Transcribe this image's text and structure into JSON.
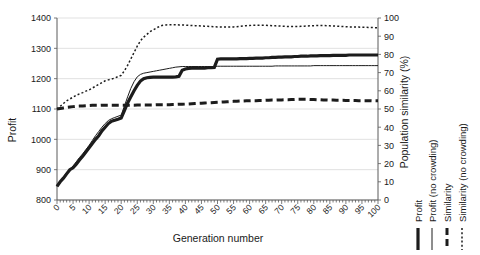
{
  "chart_data": {
    "type": "line",
    "title": "",
    "xlabel": "Generation number",
    "ylabel": "Profit",
    "y2label": "Population similarity (%)",
    "xlim": [
      0,
      100
    ],
    "ylim": [
      800,
      1400
    ],
    "y2lim": [
      0,
      100
    ],
    "grid": true,
    "legend_position": "right-outside-vertical",
    "xticks": [
      0,
      5,
      10,
      15,
      20,
      25,
      30,
      35,
      40,
      45,
      50,
      55,
      60,
      65,
      70,
      75,
      80,
      85,
      90,
      95,
      100
    ],
    "yticks": [
      800,
      900,
      1000,
      1100,
      1200,
      1300,
      1400
    ],
    "y2ticks": [
      0,
      10,
      20,
      30,
      40,
      50,
      60,
      70,
      80,
      90,
      100
    ],
    "x": [
      0,
      1,
      2,
      3,
      4,
      5,
      6,
      7,
      8,
      9,
      10,
      11,
      12,
      13,
      14,
      15,
      16,
      17,
      18,
      19,
      20,
      21,
      22,
      23,
      24,
      25,
      26,
      27,
      28,
      29,
      30,
      31,
      32,
      33,
      34,
      35,
      36,
      37,
      38,
      39,
      40,
      41,
      42,
      43,
      44,
      45,
      46,
      47,
      48,
      49,
      50,
      51,
      52,
      53,
      54,
      55,
      56,
      57,
      58,
      59,
      60,
      61,
      62,
      63,
      64,
      65,
      66,
      67,
      68,
      69,
      70,
      71,
      72,
      73,
      74,
      75,
      76,
      77,
      78,
      79,
      80,
      81,
      82,
      83,
      84,
      85,
      86,
      87,
      88,
      89,
      90,
      91,
      92,
      93,
      94,
      95,
      96,
      97,
      98,
      99,
      100
    ],
    "series": [
      {
        "name": "Profit",
        "axis": "left",
        "style": "thick-solid",
        "values": [
          845,
          860,
          872,
          886,
          900,
          906,
          918,
          932,
          944,
          958,
          972,
          986,
          1000,
          1012,
          1028,
          1040,
          1052,
          1060,
          1063,
          1066,
          1070,
          1095,
          1120,
          1140,
          1160,
          1178,
          1192,
          1200,
          1203,
          1204,
          1205,
          1205,
          1205,
          1205,
          1205,
          1205,
          1205,
          1206,
          1208,
          1228,
          1232,
          1234,
          1235,
          1235,
          1235,
          1235,
          1235,
          1236,
          1236,
          1237,
          1264,
          1265,
          1265,
          1265,
          1265,
          1265,
          1265,
          1266,
          1266,
          1266,
          1267,
          1267,
          1268,
          1268,
          1268,
          1269,
          1269,
          1270,
          1270,
          1271,
          1271,
          1272,
          1272,
          1272,
          1273,
          1273,
          1274,
          1274,
          1274,
          1275,
          1275,
          1275,
          1276,
          1276,
          1276,
          1276,
          1277,
          1277,
          1277,
          1277,
          1277,
          1278,
          1278,
          1278,
          1278,
          1278,
          1278,
          1278,
          1278,
          1278,
          1278
        ]
      },
      {
        "name": "Profit (no crowding)",
        "axis": "left",
        "style": "thin-solid",
        "values": [
          845,
          862,
          876,
          890,
          902,
          912,
          926,
          940,
          952,
          966,
          980,
          996,
          1012,
          1026,
          1040,
          1052,
          1062,
          1068,
          1072,
          1076,
          1080,
          1110,
          1140,
          1168,
          1190,
          1206,
          1214,
          1218,
          1220,
          1222,
          1224,
          1226,
          1228,
          1230,
          1232,
          1234,
          1236,
          1238,
          1239,
          1240,
          1240,
          1240,
          1240,
          1240,
          1240,
          1240,
          1240,
          1240,
          1240,
          1240,
          1241,
          1241,
          1241,
          1241,
          1241,
          1241,
          1241,
          1241,
          1241,
          1241,
          1241,
          1241,
          1241,
          1241,
          1241,
          1241,
          1241,
          1241,
          1242,
          1242,
          1242,
          1242,
          1242,
          1242,
          1242,
          1242,
          1242,
          1242,
          1242,
          1242,
          1243,
          1243,
          1243,
          1243,
          1243,
          1243,
          1243,
          1243,
          1243,
          1243,
          1243,
          1243,
          1243,
          1243,
          1243,
          1243,
          1243,
          1243,
          1243,
          1243,
          1243
        ]
      },
      {
        "name": "Similarity",
        "axis": "right",
        "style": "thick-dashed",
        "values": [
          50.0,
          50.3,
          50.6,
          50.9,
          51.1,
          51.3,
          51.5,
          51.6,
          51.7,
          51.8,
          51.9,
          52.0,
          52.0,
          52.0,
          52.1,
          52.1,
          52.1,
          52.1,
          52.1,
          52.1,
          52.1,
          52.1,
          52.1,
          52.1,
          52.1,
          52.2,
          52.2,
          52.2,
          52.2,
          52.2,
          52.2,
          52.3,
          52.3,
          52.3,
          52.4,
          52.4,
          52.5,
          52.5,
          52.6,
          52.6,
          52.7,
          52.8,
          52.9,
          53.0,
          53.1,
          53.2,
          53.3,
          53.4,
          53.5,
          53.6,
          53.7,
          53.8,
          53.9,
          54.0,
          54.1,
          54.2,
          54.3,
          54.4,
          54.4,
          54.5,
          54.5,
          54.6,
          54.6,
          54.7,
          54.7,
          54.8,
          54.8,
          54.9,
          54.9,
          55.0,
          55.0,
          55.1,
          55.1,
          55.2,
          55.2,
          55.3,
          55.3,
          55.3,
          55.3,
          55.2,
          55.2,
          55.1,
          55.1,
          55.0,
          55.0,
          54.9,
          54.9,
          54.8,
          54.8,
          54.8,
          54.7,
          54.7,
          54.7,
          54.7,
          54.6,
          54.6,
          54.6,
          54.6,
          54.5,
          54.5,
          54.5
        ]
      },
      {
        "name": "Similarity (no crowding)",
        "axis": "right",
        "style": "dotted",
        "values": [
          50.0,
          51.5,
          53.0,
          54.5,
          55.5,
          56.5,
          57.5,
          58.3,
          59.0,
          59.8,
          60.5,
          61.5,
          62.5,
          63.5,
          64.5,
          65.5,
          66.0,
          66.5,
          67.0,
          67.8,
          68.5,
          71.0,
          74.0,
          77.5,
          81.0,
          84.5,
          87.5,
          89.5,
          91.0,
          92.5,
          93.5,
          94.5,
          95.5,
          96.0,
          96.2,
          96.3,
          96.3,
          96.3,
          96.2,
          96.2,
          96.1,
          96.0,
          95.9,
          95.8,
          95.7,
          95.6,
          95.5,
          95.4,
          95.3,
          95.2,
          95.1,
          95.1,
          95.0,
          95.0,
          95.0,
          95.1,
          95.2,
          95.4,
          95.6,
          95.8,
          95.9,
          96.0,
          96.0,
          96.0,
          96.0,
          96.0,
          95.9,
          95.8,
          95.7,
          95.6,
          95.5,
          95.4,
          95.3,
          95.3,
          95.3,
          95.3,
          95.4,
          95.5,
          95.6,
          95.7,
          95.8,
          95.9,
          95.9,
          95.9,
          95.8,
          95.7,
          95.6,
          95.5,
          95.4,
          95.3,
          95.2,
          95.1,
          95.1,
          95.0,
          95.0,
          94.9,
          94.9,
          94.8,
          94.8,
          94.7,
          94.7
        ]
      }
    ]
  },
  "legend": {
    "items": [
      {
        "label": "Profit",
        "style": "thick-solid"
      },
      {
        "label": "Profit (no crowding)",
        "style": "thin-solid"
      },
      {
        "label": "Similarity",
        "style": "thick-dashed"
      },
      {
        "label": "Similarity (no crowding)",
        "style": "dotted"
      }
    ]
  },
  "colors": {
    "ink": "#1c1c1c",
    "grid": "#d9d9d9",
    "axis": "#5a5a5a",
    "background": "#ffffff"
  }
}
